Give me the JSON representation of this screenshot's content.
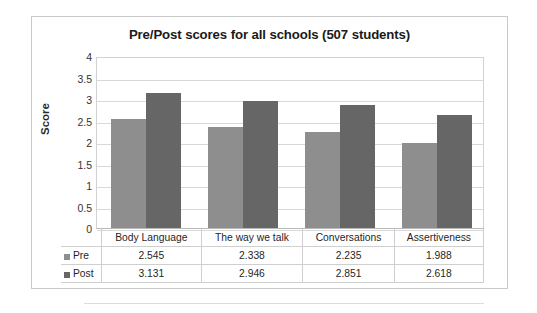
{
  "chart_data": {
    "type": "bar",
    "title": "Pre/Post scores for all schools (507 students)",
    "xlabel": "",
    "ylabel": "Score",
    "ylim": [
      0,
      4
    ],
    "ytick_step": 0.5,
    "yticks": [
      "4",
      "3.5",
      "3",
      "2.5",
      "2",
      "1.5",
      "1",
      "0.5",
      "0"
    ],
    "grid": true,
    "legend_position": "data-table-left",
    "categories": [
      "Body Language",
      "The way we talk",
      "Conversations",
      "Assertiveness"
    ],
    "series": [
      {
        "name": "Pre",
        "color": "#8e8e8e",
        "values": [
          2.545,
          2.338,
          2.235,
          1.988
        ],
        "labels": [
          "2.545",
          "2.338",
          "2.235",
          "1.988"
        ]
      },
      {
        "name": "Post",
        "color": "#666666",
        "values": [
          3.131,
          2.946,
          2.851,
          2.618
        ],
        "labels": [
          "3.131",
          "2.946",
          "2.851",
          "2.618"
        ]
      }
    ]
  }
}
